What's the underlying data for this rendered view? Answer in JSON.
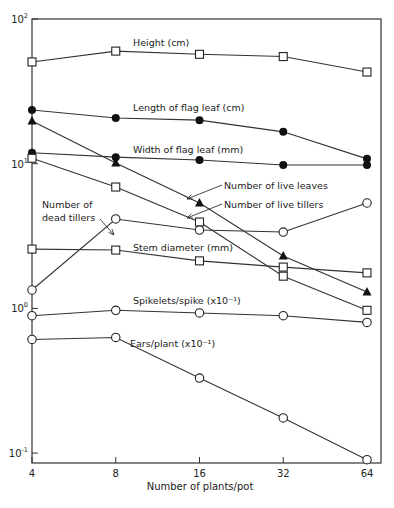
{
  "chart_data": {
    "type": "line",
    "title": "",
    "xlabel": "Number of plants/pot",
    "ylabel": "",
    "x_scale": "log2",
    "y_scale": "log10",
    "x": [
      4,
      8,
      16,
      32,
      64
    ],
    "x_tick_labels": [
      "4",
      "8",
      "16",
      "32",
      "64"
    ],
    "ylim": [
      0.08,
      100
    ],
    "y_tick_labels": [
      {
        "value": 100,
        "base": "10",
        "exp": "2"
      },
      {
        "value": 10,
        "base": "10",
        "exp": "1"
      },
      {
        "value": 1,
        "base": "10",
        "exp": "0"
      },
      {
        "value": 0.1,
        "base": "10",
        "exp": "-1"
      }
    ],
    "grid": false,
    "series": [
      {
        "name": "Height (cm)",
        "marker": "open-square",
        "values": [
          50.5,
          60,
          57,
          55,
          43
        ],
        "label": {
          "text": "Height (cm)",
          "x": 133,
          "y": 46
        }
      },
      {
        "name": "Length of flag leaf (cm)",
        "marker": "filled-circle",
        "values": [
          23.5,
          20.7,
          20,
          16.6,
          10.8
        ],
        "label": {
          "text": "Length of flag leaf (cm)",
          "x": 133,
          "y": 111
        }
      },
      {
        "name": "Width of flag leaf (mm)",
        "marker": "filled-circle",
        "values": [
          11.9,
          11.1,
          10.6,
          9.8,
          9.8
        ],
        "label": {
          "text": "Width of flag leaf (mm)",
          "x": 133,
          "y": 153
        }
      },
      {
        "name": "Number of live leaves",
        "marker": "filled-triangle",
        "values": [
          19.7,
          10.1,
          5.35,
          2.3,
          1.3
        ],
        "label": {
          "text": "Number of live leaves",
          "x": 224,
          "y": 189
        }
      },
      {
        "name": "Number of live tillers",
        "marker": "open-square",
        "values": [
          10.9,
          6.9,
          3.95,
          1.67,
          0.97
        ],
        "label": {
          "text": "Number of live tillers",
          "x": 224,
          "y": 208
        }
      },
      {
        "name": "Number of dead tillers",
        "marker": "open-circle",
        "values": [
          1.34,
          4.15,
          3.48,
          3.37,
          5.35
        ],
        "label": {
          "text": "Number of dead tillers",
          "x": 42,
          "y": 211
        }
      },
      {
        "name": "Stem diameter (mm)",
        "marker": "open-square",
        "values": [
          2.57,
          2.53,
          2.13,
          1.93,
          1.76
        ],
        "label": {
          "text": "Stem diameter (mm)",
          "x": 133,
          "y": 251
        }
      },
      {
        "name": "Spikelets/spike (x10^-1)",
        "marker": "open-circle",
        "values": [
          0.89,
          0.97,
          0.93,
          0.89,
          0.8
        ],
        "label": {
          "text": "Spikelets/spike (x10⁻¹)",
          "x": 133,
          "y": 304
        }
      },
      {
        "name": "Ears/plant (x10^-1)",
        "marker": "open-circle",
        "values": [
          0.61,
          0.63,
          0.33,
          0.175,
          0.09
        ],
        "label": {
          "text": "Ears/plant (x10⁻¹)",
          "x": 130,
          "y": 347
        }
      }
    ],
    "annotations": [
      {
        "text": "Number of live leaves",
        "arrow_from": [
          222,
          185
        ],
        "arrow_to": [
          187,
          199
        ]
      },
      {
        "text": "Number of live tillers",
        "arrow_from": [
          222,
          204
        ],
        "arrow_to": [
          187,
          218
        ]
      },
      {
        "text": "Number of dead tillers",
        "arrow_from": [
          100,
          219
        ],
        "arrow_to": [
          114,
          235
        ]
      }
    ]
  },
  "axes": {
    "x_label": "Number of plants/pot",
    "dead_tillers_line1": "Number of",
    "dead_tillers_line2": "dead tillers"
  }
}
